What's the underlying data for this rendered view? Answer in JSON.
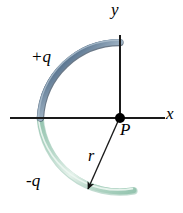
{
  "figure": {
    "kind": "physics-diagram",
    "background_color": "#ffffff",
    "width": 183,
    "height": 213
  },
  "axes": {
    "x_axis": {
      "label": "x",
      "color": "#1a1a1a",
      "y_position": 118,
      "x_start": 10,
      "x_end": 165
    },
    "y_axis": {
      "label": "y",
      "color": "#1a1a1a",
      "x_position": 120,
      "y_start": 35,
      "y_end": 118
    }
  },
  "origin": {
    "label": "P",
    "x": 120,
    "y": 118,
    "dot_color": "#000000",
    "dot_radius": 5
  },
  "arcs": [
    {
      "name": "upper-arc-positive-charge",
      "label": "+q",
      "charge_sign": "positive",
      "color": "#5a7590",
      "highlight_color": "#95aabd",
      "shadow_color": "#3d5065",
      "quadrant": "upper-left",
      "radius": 80,
      "start_angle_deg": 90,
      "end_angle_deg": 180
    },
    {
      "name": "lower-arc-negative-charge",
      "label": "-q",
      "charge_sign": "negative",
      "color": "#b7d8c9",
      "highlight_color": "#ddeee6",
      "shadow_color": "#8fc0ab",
      "quadrant": "lower-left",
      "radius": 80,
      "start_angle_deg": 180,
      "end_angle_deg": 270
    }
  ],
  "radius_arrow": {
    "label": "r",
    "color": "#1a1a1a",
    "from_x": 120,
    "from_y": 118,
    "to_x": 86,
    "to_y": 192,
    "arrowhead": "filled-triangle"
  }
}
